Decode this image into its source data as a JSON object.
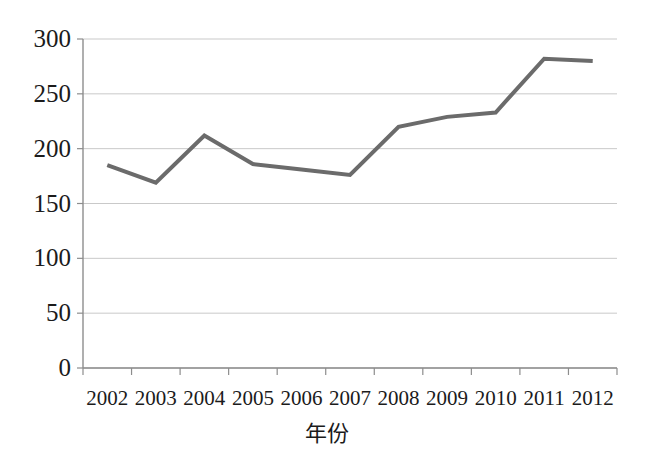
{
  "chart_data": {
    "type": "line",
    "title": "",
    "subtitle": "",
    "xlabel": "年份",
    "ylabel": "",
    "categories": [
      "2002",
      "2003",
      "2004",
      "2005",
      "2006",
      "2007",
      "2008",
      "2009",
      "2010",
      "2011",
      "2012"
    ],
    "values": [
      185,
      169,
      212,
      186,
      181,
      176,
      220,
      229,
      233,
      282,
      280
    ],
    "series": [
      {
        "name": "",
        "values": [
          185,
          169,
          212,
          186,
          181,
          176,
          220,
          229,
          233,
          282,
          280
        ]
      }
    ],
    "ylim": [
      0,
      300
    ],
    "yticks": [
      0,
      50,
      100,
      150,
      200,
      250,
      300
    ],
    "ytick_labels": [
      "0",
      "50",
      "100",
      "150",
      "200",
      "250",
      "300"
    ],
    "xtick_labels": [
      "2002",
      "2003",
      "2004",
      "2005",
      "2006",
      "2007",
      "2008",
      "2009",
      "2010",
      "2011",
      "2012"
    ],
    "grid": true,
    "grid_axis": "y",
    "legend": false,
    "legend_position": "none",
    "annotations": [],
    "colors": {
      "line": "#6b6b6b",
      "grid": "#c9c9c9",
      "axis": "#8d8d8d",
      "text": "#1b1b1b",
      "background": "#ffffff"
    },
    "line_width": 4,
    "markers": false
  }
}
